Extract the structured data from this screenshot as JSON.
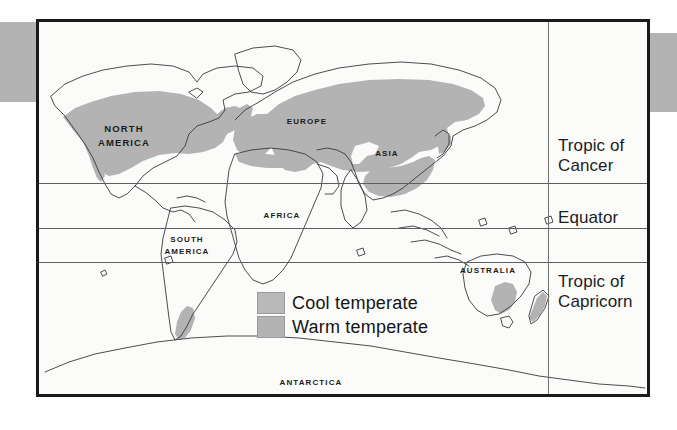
{
  "figure": {
    "type": "thematic-world-map"
  },
  "legend": {
    "items": [
      {
        "label": "Cool temperate",
        "color": "#b9b9b9",
        "swatch_name": "cool-temperate-swatch"
      },
      {
        "label": "Warm temperate",
        "color": "#b3b3b3",
        "swatch_name": "warm-temperate-swatch"
      }
    ]
  },
  "latitude_lines": [
    {
      "id": "cancer",
      "label": "Tropic of\nCancer"
    },
    {
      "id": "equator",
      "label": "Equator"
    },
    {
      "id": "capricorn",
      "label": "Tropic of\nCapricorn"
    }
  ],
  "places": [
    {
      "id": "north-america",
      "label": "North\nAmerica"
    },
    {
      "id": "south-america",
      "label": "South\nAmerica"
    },
    {
      "id": "europe",
      "label": "Europe"
    },
    {
      "id": "asia",
      "label": "Asia"
    },
    {
      "id": "africa",
      "label": "Africa"
    },
    {
      "id": "australia",
      "label": "Australia"
    },
    {
      "id": "antarctica",
      "label": "Antarctica"
    }
  ],
  "colors": {
    "frame": "#1a1a1a",
    "plate_background": "#fbfbfa",
    "shaded_region": "#b3b3b3",
    "coastline": "#3a3a3a",
    "side_band": "#b3b3b3",
    "latitude_line": "#5e5e5e"
  }
}
